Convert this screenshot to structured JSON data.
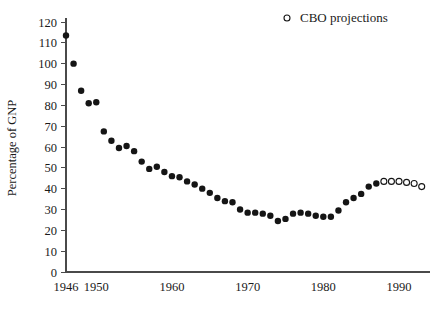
{
  "chart_data": {
    "type": "scatter",
    "title": "",
    "xlabel": "",
    "ylabel": "Percentage of GNP",
    "xlim": [
      1945,
      1994
    ],
    "ylim": [
      0,
      120
    ],
    "grid": false,
    "legend_position": "top-right",
    "y_ticks": [
      0,
      10,
      20,
      30,
      40,
      50,
      60,
      70,
      80,
      90,
      100,
      110,
      120
    ],
    "x_ticks": [
      1946,
      1950,
      1960,
      1970,
      1980,
      1990
    ],
    "x_tick_labels": [
      "1946",
      "1950",
      "1960",
      "1970",
      "1980",
      "1990"
    ],
    "series": [
      {
        "name": "Actual",
        "marker": "filled-circle",
        "color": "#151515",
        "x": [
          1946,
          1947,
          1948,
          1949,
          1950,
          1951,
          1952,
          1953,
          1954,
          1955,
          1956,
          1957,
          1958,
          1959,
          1960,
          1961,
          1962,
          1963,
          1964,
          1965,
          1966,
          1967,
          1968,
          1969,
          1970,
          1971,
          1972,
          1973,
          1974,
          1975,
          1976,
          1977,
          1978,
          1979,
          1980,
          1981,
          1982,
          1983,
          1984,
          1985,
          1986,
          1987
        ],
        "y": [
          113.5,
          100.0,
          87.0,
          81.0,
          81.5,
          67.5,
          63.0,
          59.5,
          60.5,
          58.0,
          53.0,
          49.5,
          50.5,
          48.0,
          46.0,
          45.5,
          43.5,
          42.0,
          40.0,
          38.0,
          35.5,
          34.0,
          33.5,
          30.0,
          28.5,
          28.5,
          28.0,
          27.0,
          24.5,
          25.5,
          28.0,
          28.5,
          28.0,
          27.0,
          26.5,
          26.5,
          29.5,
          33.5,
          35.5,
          37.5,
          41.0,
          42.5
        ]
      },
      {
        "name": "CBO projections",
        "marker": "open-circle",
        "color": "#151515",
        "x": [
          1988,
          1989,
          1990,
          1991,
          1992,
          1993
        ],
        "y": [
          43.5,
          43.5,
          43.5,
          43.0,
          42.5,
          41.0
        ]
      }
    ],
    "legend": [
      {
        "label": "CBO projections",
        "marker": "open-circle"
      }
    ]
  },
  "axes": {
    "y_title": "Percentage of GNP"
  }
}
